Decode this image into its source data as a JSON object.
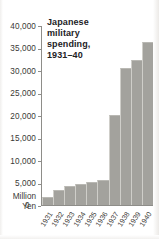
{
  "chart_data": {
    "type": "bar",
    "title": "Japanese military spending, 1931–40",
    "title_lines": [
      "Japanese",
      "military",
      "spending,",
      "1931–40"
    ],
    "xlabel": "",
    "ylabel": "Million Yen",
    "ylabel_lines": [
      "Million",
      "Yen"
    ],
    "categories": [
      "1931",
      "1932",
      "1933",
      "1934",
      "1935",
      "1936",
      "1937",
      "1938",
      "1939",
      "1940"
    ],
    "values": [
      1800,
      3300,
      4200,
      4800,
      5200,
      5600,
      20100,
      30700,
      32400,
      36500
    ],
    "ylim": [
      0,
      40000
    ],
    "ytick_labels": [
      "40,000",
      "35,000",
      "30,000",
      "25,000",
      "20,000",
      "15,000",
      "10,000",
      "5,000",
      "0"
    ],
    "ytick_values": [
      40000,
      35000,
      30000,
      25000,
      20000,
      15000,
      10000,
      5000,
      0
    ],
    "grid": false,
    "legend": false,
    "bar_color": "#a3a29d",
    "axis_color": "#8e8d89",
    "text_color": "#3a3936",
    "background": "#ffffff"
  }
}
